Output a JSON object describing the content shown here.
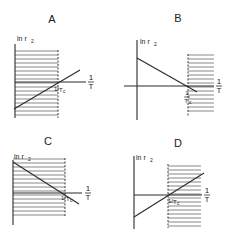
{
  "figure": {
    "colors": {
      "ink": "#2a2a2a",
      "hatch": "#555555",
      "background": "#ffffff"
    },
    "axis_y_label": "ln r",
    "axis_y_label_sub": "2",
    "axis_x_label_num": "1",
    "axis_x_label_den": "T",
    "tc_label_prefix": "1/",
    "tc_label": "T",
    "tc_label_sub": "c",
    "panels": [
      {
        "id": "A",
        "title": "A",
        "title_pos": [
          52,
          23
        ],
        "yaxis": {
          "x": 15,
          "y1": 44,
          "y2": 118
        },
        "xaxis": {
          "y": 82,
          "x1": 15,
          "x2": 86
        },
        "diag": {
          "x1": 14,
          "y1": 109,
          "x2": 80,
          "y2": 70
        },
        "dashed_x": 58,
        "dashed_y1": 50,
        "dashed_y2": 118,
        "hatch": {
          "x1": 15,
          "x2": 58,
          "y1": 51,
          "y2": 117,
          "step": 4
        },
        "ylabel_pos": [
          17,
          41
        ],
        "xlabel_pos": [
          91,
          82
        ],
        "tc_pos": [
          54,
          91
        ],
        "tc_style": "slash"
      },
      {
        "id": "B",
        "title": "B",
        "title_pos": [
          178,
          22
        ],
        "yaxis": {
          "x": 137,
          "y1": 40,
          "y2": 120
        },
        "xaxis": {
          "y": 86,
          "x1": 124,
          "x2": 214
        },
        "diag": {
          "x1": 137,
          "y1": 58,
          "x2": 197,
          "y2": 92
        },
        "dashed_x": 188,
        "dashed_y1": 54,
        "dashed_y2": 116,
        "hatch": {
          "x1": 188,
          "x2": 214,
          "y1": 55,
          "y2": 113,
          "step": 4
        },
        "ylabel_pos": [
          140,
          44
        ],
        "xlabel_pos": [
          219,
          86
        ],
        "tc_pos": [
          187,
          92
        ],
        "tc_style": "stacked"
      },
      {
        "id": "C",
        "title": "C",
        "title_pos": [
          48,
          145
        ],
        "yaxis": {
          "x": 13,
          "y1": 160,
          "y2": 225
        },
        "xaxis": {
          "y": 193,
          "x1": 13,
          "x2": 82
        },
        "diag": {
          "x1": 13,
          "y1": 162,
          "x2": 79,
          "y2": 204
        },
        "dashed_x": 65,
        "dashed_y1": 158,
        "dashed_y2": 216,
        "hatch": {
          "x1": 13,
          "x2": 65,
          "y1": 159,
          "y2": 215,
          "step": 4
        },
        "ylabel_pos": [
          14,
          159
        ],
        "xlabel_pos": [
          88,
          193
        ],
        "tc_pos": [
          61,
          200
        ],
        "tc_style": "slash"
      },
      {
        "id": "D",
        "title": "D",
        "title_pos": [
          178,
          147
        ],
        "yaxis": {
          "x": 134,
          "y1": 156,
          "y2": 229
        },
        "xaxis": {
          "y": 195,
          "x1": 134,
          "x2": 202
        },
        "diag": {
          "x1": 134,
          "y1": 217,
          "x2": 204,
          "y2": 173
        },
        "dashed_x": 168,
        "dashed_y1": 164,
        "dashed_y2": 228,
        "hatch": {
          "x1": 168,
          "x2": 201,
          "y1": 166,
          "y2": 227,
          "step": 4
        },
        "ylabel_pos": [
          136,
          160
        ],
        "xlabel_pos": [
          207,
          195
        ],
        "tc_pos": [
          168,
          203
        ],
        "tc_style": "slash"
      }
    ]
  }
}
